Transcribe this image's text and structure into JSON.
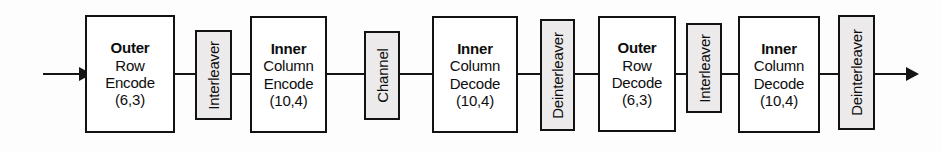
{
  "diagram": {
    "colors": {
      "line": "#141414",
      "block_border": "#121212",
      "block_fill": "#ffffff",
      "vblock_fill": "#eceaea",
      "background": "#fdfdfd",
      "text": "#0d0d0d"
    },
    "input_arrow": "input-signal-arrow",
    "output_arrow": "output-signal-arrow",
    "blocks": [
      {
        "id": "outer-row-encode",
        "kind": "process",
        "line1": "Outer",
        "line2": "Row",
        "line3": "Encode",
        "line4": "(6,3)"
      },
      {
        "id": "interleaver-1",
        "kind": "vertical",
        "label": "Interleaver"
      },
      {
        "id": "inner-column-encode",
        "kind": "process",
        "line1": "Inner",
        "line2": "Column",
        "line3": "Encode",
        "line4": "(10,4)"
      },
      {
        "id": "channel",
        "kind": "vertical",
        "label": "Channel"
      },
      {
        "id": "inner-column-decode-1",
        "kind": "process",
        "line1": "Inner",
        "line2": "Column",
        "line3": "Decode",
        "line4": "(10,4)"
      },
      {
        "id": "deinterleaver-1",
        "kind": "vertical",
        "label": "Deinterleaver"
      },
      {
        "id": "outer-row-decode",
        "kind": "process",
        "line1": "Outer",
        "line2": "Row",
        "line3": "Decode",
        "line4": "(6,3)"
      },
      {
        "id": "interleaver-2",
        "kind": "vertical",
        "label": "Interleaver"
      },
      {
        "id": "inner-column-decode-2",
        "kind": "process",
        "line1": "Inner",
        "line2": "Column",
        "line3": "Decode",
        "line4": "(10,4)"
      },
      {
        "id": "deinterleaver-2",
        "kind": "vertical",
        "label": "Deinterleaver"
      }
    ]
  }
}
